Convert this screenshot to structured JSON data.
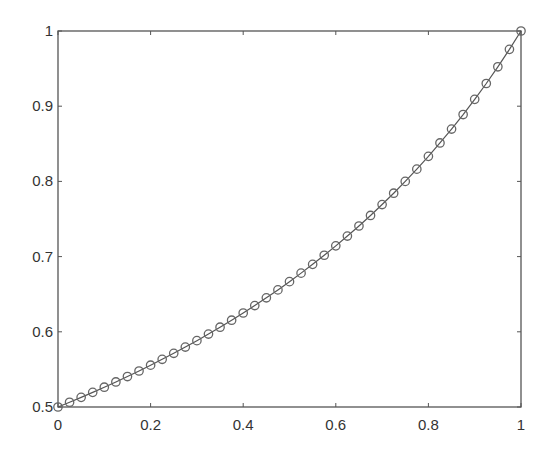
{
  "chart_data": {
    "type": "line",
    "title": "",
    "xlabel": "",
    "ylabel": "",
    "xlim": [
      0,
      1
    ],
    "ylim": [
      0.5,
      1
    ],
    "grid": false,
    "legend": null,
    "x_ticks": [
      "0",
      "0.2",
      "0.4",
      "0.6",
      "0.8",
      "1"
    ],
    "y_ticks": [
      "0.5",
      "0.6",
      "0.7",
      "0.8",
      "0.9",
      "1"
    ],
    "marker": "circle",
    "line_color": "#555555",
    "marker_color": "#666666",
    "series": [
      {
        "name": "",
        "x": [
          0,
          0.025,
          0.05,
          0.075,
          0.1,
          0.125,
          0.15,
          0.175,
          0.2,
          0.225,
          0.25,
          0.275,
          0.3,
          0.325,
          0.35,
          0.375,
          0.4,
          0.425,
          0.45,
          0.475,
          0.5,
          0.525,
          0.55,
          0.575,
          0.6,
          0.625,
          0.65,
          0.675,
          0.7,
          0.725,
          0.75,
          0.775,
          0.8,
          0.825,
          0.85,
          0.875,
          0.9,
          0.925,
          0.95,
          0.975,
          1
        ],
        "values": [
          0.5,
          0.5063,
          0.5128,
          0.5195,
          0.5263,
          0.5333,
          0.5405,
          0.5479,
          0.5556,
          0.5634,
          0.5714,
          0.5797,
          0.5882,
          0.597,
          0.6061,
          0.6154,
          0.625,
          0.6349,
          0.6452,
          0.6557,
          0.6667,
          0.678,
          0.6897,
          0.7018,
          0.7143,
          0.7273,
          0.7407,
          0.7547,
          0.7692,
          0.7843,
          0.8,
          0.8163,
          0.8333,
          0.8511,
          0.8696,
          0.8889,
          0.9091,
          0.9302,
          0.9524,
          0.9756,
          1
        ]
      }
    ]
  }
}
